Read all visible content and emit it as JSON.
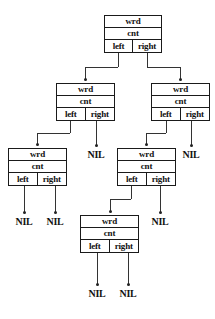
{
  "diagram": {
    "type": "binary-tree",
    "field_labels": {
      "word": "wrd",
      "count": "cnt",
      "left_pointer": "left",
      "right_pointer": "right"
    },
    "null_label": "NIL",
    "colors": {
      "background": "#ffffff",
      "border": "#1a1a1a",
      "text": "#111111",
      "edge": "#333333"
    },
    "nodes": [
      {
        "id": "root",
        "level": 1,
        "wrd": "wrd",
        "cnt": "cnt",
        "left": "left",
        "right": "right",
        "x": 104,
        "y": 15,
        "w": 58,
        "h": 38
      },
      {
        "id": "n-l",
        "level": 2,
        "wrd": "wrd",
        "cnt": "cnt",
        "left": "left",
        "right": "right",
        "x": 56,
        "y": 83,
        "w": 59,
        "h": 38
      },
      {
        "id": "n-r",
        "level": 2,
        "wrd": "wrd",
        "cnt": "cnt",
        "left": "left",
        "right": "right",
        "x": 151,
        "y": 83,
        "w": 59,
        "h": 38
      },
      {
        "id": "n-ll",
        "level": 3,
        "wrd": "wrd",
        "cnt": "cnt",
        "left": "left",
        "right": "right",
        "x": 8,
        "y": 148,
        "w": 59,
        "h": 38
      },
      {
        "id": "n-rl",
        "level": 3,
        "wrd": "wrd",
        "cnt": "cnt",
        "left": "left",
        "right": "right",
        "x": 117,
        "y": 148,
        "w": 59,
        "h": 38
      },
      {
        "id": "n-rll",
        "level": 4,
        "wrd": "wrd",
        "cnt": "cnt",
        "left": "left",
        "right": "right",
        "x": 80,
        "y": 215,
        "w": 59,
        "h": 38
      }
    ],
    "nil_leaves": [
      {
        "id": "nil-1",
        "label": "NIL",
        "x": 84,
        "y": 149,
        "w": 24,
        "parent": "n-l",
        "pointer": "right"
      },
      {
        "id": "nil-2",
        "label": "NIL",
        "x": 179,
        "y": 149,
        "w": 24,
        "parent": "n-r",
        "pointer": "right"
      },
      {
        "id": "nil-3",
        "label": "NIL",
        "x": 12,
        "y": 216,
        "w": 24,
        "parent": "n-ll",
        "pointer": "left"
      },
      {
        "id": "nil-4",
        "label": "NIL",
        "x": 43,
        "y": 216,
        "w": 24,
        "parent": "n-ll",
        "pointer": "right"
      },
      {
        "id": "nil-5",
        "label": "NIL",
        "x": 148,
        "y": 216,
        "w": 24,
        "parent": "n-rl",
        "pointer": "right"
      },
      {
        "id": "nil-6",
        "label": "NIL",
        "x": 85,
        "y": 288,
        "w": 24,
        "parent": "n-rll",
        "pointer": "left"
      },
      {
        "id": "nil-7",
        "label": "NIL",
        "x": 116,
        "y": 288,
        "w": 24,
        "parent": "n-rll",
        "pointer": "right"
      }
    ],
    "edges": [
      {
        "id": "e-root-left",
        "from": "root",
        "pointer": "left",
        "to": "n-l",
        "x": 118,
        "y1": 53,
        "y2": 80,
        "elbow_x": 85
      },
      {
        "id": "e-root-right",
        "from": "root",
        "pointer": "right",
        "to": "n-r",
        "x": 147,
        "y1": 53,
        "y2": 80,
        "elbow_x": 180
      },
      {
        "id": "e-nl-left",
        "from": "n-l",
        "pointer": "left",
        "to": "n-ll",
        "x": 70,
        "y1": 121,
        "y2": 145,
        "elbow_x": 37
      },
      {
        "id": "e-nl-right",
        "from": "n-l",
        "pointer": "right",
        "to": "nil-1",
        "x": 96,
        "y1": 121,
        "y2": 146,
        "elbow_x": 96
      },
      {
        "id": "e-nr-left",
        "from": "n-r",
        "pointer": "left",
        "to": "n-rl",
        "x": 166,
        "y1": 121,
        "y2": 145,
        "elbow_x": 146
      },
      {
        "id": "e-nr-right",
        "from": "n-r",
        "pointer": "right",
        "to": "nil-2",
        "x": 191,
        "y1": 121,
        "y2": 146,
        "elbow_x": 191
      },
      {
        "id": "e-nll-left",
        "from": "n-ll",
        "pointer": "left",
        "to": "nil-3",
        "x": 24,
        "y1": 186,
        "y2": 213,
        "elbow_x": 24
      },
      {
        "id": "e-nll-right",
        "from": "n-ll",
        "pointer": "right",
        "to": "nil-4",
        "x": 55,
        "y1": 186,
        "y2": 213,
        "elbow_x": 55
      },
      {
        "id": "e-nrl-left",
        "from": "n-rl",
        "pointer": "left",
        "to": "n-rll",
        "x": 131,
        "y1": 186,
        "y2": 212,
        "elbow_x": 110
      },
      {
        "id": "e-nrl-right",
        "from": "n-rl",
        "pointer": "right",
        "to": "nil-5",
        "x": 160,
        "y1": 186,
        "y2": 213,
        "elbow_x": 160
      },
      {
        "id": "e-nrll-left",
        "from": "n-rll",
        "pointer": "left",
        "to": "nil-6",
        "x": 97,
        "y1": 253,
        "y2": 285,
        "elbow_x": 97
      },
      {
        "id": "e-nrll-right",
        "from": "n-rll",
        "pointer": "right",
        "to": "nil-7",
        "x": 128,
        "y1": 253,
        "y2": 285,
        "elbow_x": 128
      }
    ]
  }
}
